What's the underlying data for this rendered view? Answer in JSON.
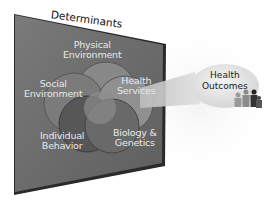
{
  "diagram": {
    "panel_title": "Determinants",
    "determinants": [
      {
        "label_line1": "Physical",
        "label_line2": "Environment"
      },
      {
        "label_line1": "Social",
        "label_line2": "Environment"
      },
      {
        "label_line1": "Health",
        "label_line2": "Services"
      },
      {
        "label_line1": "Individual",
        "label_line2": "Behavior"
      },
      {
        "label_line1": "Biology &",
        "label_line2": "Genetics"
      }
    ],
    "outcome": {
      "label_line1": "Health",
      "label_line2": "Outcomes"
    },
    "icons": [
      "people-group-icon"
    ],
    "colors": {
      "panel": "#6e6e6e",
      "panel_edge": "#2a2a2a",
      "label_text": "#e8e8e8",
      "outcome_bubble": "#e4e4e4"
    }
  }
}
